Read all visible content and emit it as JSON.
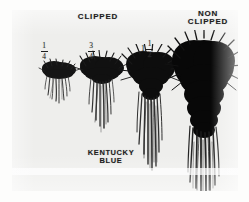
{
  "figure": {
    "kind": "scanned-photograph",
    "plate_background_color": "#eeeeec",
    "ink_color": "#1d1d1d",
    "page_background_color": "#ffffff"
  },
  "headers": {
    "clipped": "CLIPPED",
    "non_clipped": "NON\nCLIPPED"
  },
  "caption": {
    "species": "KENTUCKY\nBLUE"
  },
  "specimens": [
    {
      "id": "specimen-quarter-inch",
      "height_label": {
        "whole": "",
        "numerator": "1",
        "denominator": "4"
      },
      "shoot_size": "smallest",
      "root_depth": "shortest"
    },
    {
      "id": "specimen-three-quarter-inch",
      "height_label": {
        "whole": "",
        "numerator": "3",
        "denominator": "4"
      },
      "shoot_size": "small",
      "root_depth": "short"
    },
    {
      "id": "specimen-one-and-half-inch",
      "height_label": {
        "whole": "1",
        "numerator": "1",
        "denominator": "2"
      },
      "shoot_size": "large",
      "root_depth": "long"
    },
    {
      "id": "specimen-non-clipped",
      "height_label": {
        "whole": "",
        "numerator": "",
        "denominator": ""
      },
      "shoot_size": "largest",
      "root_depth": "longest"
    }
  ]
}
